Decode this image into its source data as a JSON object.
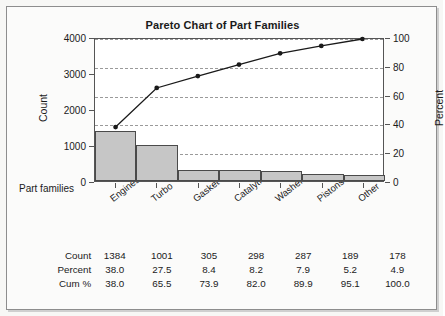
{
  "chart_data": {
    "type": "bar",
    "title": "Pareto Chart of Part Families",
    "xlabel": "Part families",
    "ylabel": "Count",
    "y2label": "Percent",
    "categories": [
      "Engines",
      "Turbo",
      "Gasket",
      "Catalytic converters",
      "Washers",
      "Pistons",
      "Other"
    ],
    "values": [
      1384,
      1001,
      305,
      298,
      287,
      189,
      178
    ],
    "series": [
      {
        "name": "Count",
        "values": [
          1384,
          1001,
          305,
          298,
          287,
          189,
          178
        ]
      },
      {
        "name": "Percent",
        "values": [
          38.0,
          27.5,
          8.4,
          8.2,
          7.9,
          5.2,
          4.9
        ]
      },
      {
        "name": "Cum %",
        "values": [
          38.0,
          65.5,
          73.9,
          82.0,
          89.9,
          95.1,
          100.0
        ]
      }
    ],
    "ylim": [
      0,
      4000
    ],
    "yticks": [
      0,
      1000,
      2000,
      3000,
      4000
    ],
    "y2lim": [
      0,
      100
    ],
    "y2ticks": [
      0,
      20,
      40,
      60,
      80,
      100
    ],
    "grid": true,
    "legend": "none",
    "bar_color": "#c6c6c6",
    "bar_edge_color": "#4a4a4a",
    "line_color": "#1a1a1a",
    "grid_color": "#9a9a9a"
  },
  "table": {
    "rows": [
      {
        "label": "Count",
        "values": [
          "1384",
          "1001",
          "305",
          "298",
          "287",
          "189",
          "178"
        ]
      },
      {
        "label": "Percent",
        "values": [
          "38.0",
          "27.5",
          "8.4",
          "8.2",
          "7.9",
          "5.2",
          "4.9"
        ]
      },
      {
        "label": "Cum %",
        "values": [
          "38.0",
          "65.5",
          "73.9",
          "82.0",
          "89.9",
          "95.1",
          "100.0"
        ]
      }
    ]
  }
}
